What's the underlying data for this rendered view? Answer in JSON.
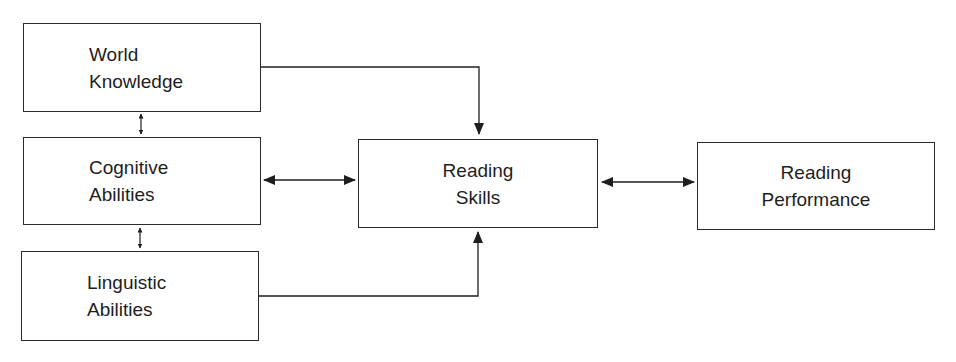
{
  "diagram": {
    "nodes": [
      {
        "id": "world_knowledge",
        "lines": [
          "World",
          "Knowledge"
        ]
      },
      {
        "id": "cognitive_abilities",
        "lines": [
          "Cognitive",
          "Abilities"
        ]
      },
      {
        "id": "linguistic_abilities",
        "lines": [
          "Linguistic",
          "Abilities"
        ]
      },
      {
        "id": "reading_skills",
        "lines": [
          "Reading",
          "Skills"
        ]
      },
      {
        "id": "reading_performance",
        "lines": [
          "Reading",
          "Performance"
        ]
      }
    ],
    "edges": [
      {
        "from": "world_knowledge",
        "to": "cognitive_abilities",
        "type": "bidirectional-small"
      },
      {
        "from": "cognitive_abilities",
        "to": "linguistic_abilities",
        "type": "bidirectional-small"
      },
      {
        "from": "world_knowledge",
        "to": "reading_skills",
        "type": "directed-elbow"
      },
      {
        "from": "linguistic_abilities",
        "to": "reading_skills",
        "type": "directed-elbow"
      },
      {
        "from": "cognitive_abilities",
        "to": "reading_skills",
        "type": "bidirectional"
      },
      {
        "from": "reading_skills",
        "to": "reading_performance",
        "type": "bidirectional"
      }
    ],
    "line_color": "#1e1e1e"
  }
}
